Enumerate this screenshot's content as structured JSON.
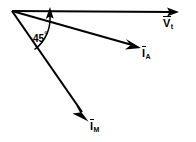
{
  "diagram": {
    "type": "phasor-vector-diagram",
    "background_color": "#ffffff",
    "stroke_color": "#000000",
    "origin": {
      "x": 12,
      "y": 11
    },
    "vectors": [
      {
        "id": "vt",
        "name": "terminal-voltage-vector",
        "symbol": "V",
        "subscript": "t",
        "overbar": true,
        "label_text": "V",
        "angle_deg": 0,
        "tip": {
          "x": 178,
          "y": 12
        },
        "description": "horizontal reference phasor pointing right"
      },
      {
        "id": "ia",
        "name": "current-a-vector",
        "symbol": "I",
        "subscript": "A",
        "overbar": true,
        "label_text": "I",
        "angle_deg": -16,
        "tip": {
          "x": 140,
          "y": 48
        },
        "description": "phasor lagging the reference by a small angle"
      },
      {
        "id": "im",
        "name": "current-m-vector",
        "symbol": "I",
        "subscript": "M",
        "overbar": true,
        "label_text": "I",
        "angle_deg": -55,
        "tip": {
          "x": 88,
          "y": 120
        },
        "description": "phasor lagging the reference by a large angle"
      }
    ],
    "angle_arc": {
      "name": "angle-arc",
      "value": "45",
      "unit": "°",
      "label": "45",
      "degree_symbol": "°",
      "from_vector": "im",
      "to_vector": "vt",
      "arrow_at": "vt",
      "radius": 38
    }
  }
}
